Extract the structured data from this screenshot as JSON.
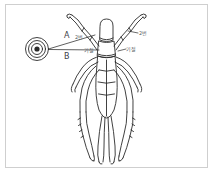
{
  "figure": {
    "type": "line-drawing-diagram",
    "background_color": "#ffffff",
    "border_color": "#cfcfcf",
    "ink_color": "#2b2b2b",
    "label_color": "#5a5f66"
  },
  "markers": {
    "target": {
      "name": "concentric-circle-target",
      "rings": 3,
      "center_x": 37,
      "center_y": 49
    }
  },
  "leaders": {
    "a": {
      "label": "A",
      "from": "target",
      "to": "left-foreleg-upper"
    },
    "b": {
      "label": "B",
      "from": "target",
      "to": "left-body-joint"
    }
  },
  "callouts": [
    {
      "id": "left-upper",
      "text": "2번",
      "x": 75,
      "y": 33
    },
    {
      "id": "left-lower",
      "text": "기절",
      "x": 84,
      "y": 46
    },
    {
      "id": "right-upper",
      "text": "2번",
      "x": 139,
      "y": 29
    },
    {
      "id": "right-lower",
      "text": "기절",
      "x": 126,
      "y": 45
    }
  ]
}
